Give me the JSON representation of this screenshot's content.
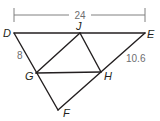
{
  "diagram": {
    "points": {
      "D": {
        "label": "D",
        "x": 14,
        "y": 33
      },
      "E": {
        "label": "E",
        "x": 145,
        "y": 33
      },
      "J": {
        "label": "J",
        "x": 80,
        "y": 33
      },
      "G": {
        "label": "G",
        "x": 36,
        "y": 73
      },
      "H": {
        "label": "H",
        "x": 101,
        "y": 72
      },
      "F": {
        "label": "F",
        "x": 58,
        "y": 110
      }
    },
    "segments": [
      [
        "D",
        "E"
      ],
      [
        "D",
        "F"
      ],
      [
        "E",
        "F"
      ],
      [
        "J",
        "G"
      ],
      [
        "J",
        "H"
      ],
      [
        "G",
        "H"
      ]
    ],
    "measurements": {
      "DE": "24",
      "DG": "8",
      "EH": "10.6"
    },
    "colors": {
      "line": "#231f20",
      "dimension": "#808080",
      "measure_text": "#6d6e70"
    }
  }
}
